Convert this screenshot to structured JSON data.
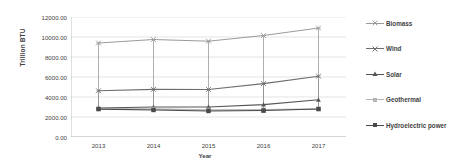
{
  "chart_data": {
    "type": "line",
    "title": "",
    "xlabel": "Year",
    "ylabel": "Trillion BTU",
    "categories": [
      "2013",
      "2014",
      "2015",
      "2016",
      "2017"
    ],
    "x": [
      2013,
      2014,
      2015,
      2016,
      2017
    ],
    "ylim": [
      0,
      12000
    ],
    "ytick_labels": [
      "12000.00",
      "10000.00",
      "8000.00",
      "6000.00",
      "4000.00",
      "2000.00",
      "0.00"
    ],
    "ytick_values": [
      12000,
      10000,
      8000,
      6000,
      4000,
      2000,
      0
    ],
    "grid": true,
    "legend_position": "right",
    "error_bars": true,
    "series": [
      {
        "name": "Biomass",
        "marker": "x-cross",
        "color": "#9a9a9a",
        "values": [
          9400,
          9750,
          9580,
          10150,
          10900
        ],
        "err_low": [
          2830,
          2950,
          2900,
          2460,
          2750
        ],
        "err_high": [
          9400,
          9750,
          9580,
          10150,
          10900
        ]
      },
      {
        "name": "Wind",
        "marker": "x-cross",
        "color": "#6e6e6e",
        "values": [
          4620,
          4760,
          4750,
          5340,
          6080
        ],
        "err_low": [
          2830,
          2950,
          2900,
          2460,
          2750
        ],
        "err_high": [
          4620,
          4760,
          4750,
          5340,
          6080
        ]
      },
      {
        "name": "Solar",
        "marker": "triangle",
        "color": "#565656",
        "values": [
          2900,
          3000,
          3000,
          3240,
          3720
        ],
        "err_low": [
          2830,
          2950,
          2900,
          2460,
          2750
        ],
        "err_high": [
          2900,
          3000,
          3000,
          3240,
          3720
        ]
      },
      {
        "name": "Geothermal",
        "marker": "square",
        "color": "#b5b5b5",
        "values": [
          2830,
          2800,
          2700,
          2720,
          2800
        ],
        "err_low": [
          2600,
          2500,
          2300,
          2460,
          2700
        ],
        "err_high": [
          2980,
          3050,
          3000,
          3180,
          3000
        ]
      },
      {
        "name": "Hydroelectric power",
        "marker": "square",
        "color": "#4a4a4a",
        "values": [
          2790,
          2700,
          2600,
          2650,
          2800
        ],
        "err_low": [
          2600,
          2500,
          2300,
          2460,
          2700
        ],
        "err_high": [
          2980,
          3050,
          3000,
          3180,
          3000
        ]
      }
    ]
  }
}
